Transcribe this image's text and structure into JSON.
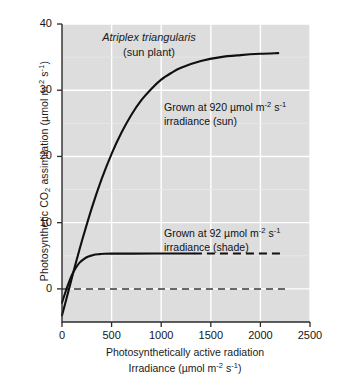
{
  "chart_data": {
    "type": "line",
    "title": "Atriplex triangularis",
    "subtitle": "(sun plant)",
    "xlabel_line1": "Photosynthetically active radiation",
    "xlabel_line2_prefix": "Irradiance (µmol m",
    "xlabel_line2_sup1": "-2",
    "xlabel_line2_mid": " s",
    "xlabel_line2_sup2": "-1",
    "xlabel_line2_suffix": ")",
    "ylabel_prefix": "Photosynthetic CO",
    "ylabel_sub": "2",
    "ylabel_mid": " assimilation (µmol m",
    "ylabel_sup1": "-2",
    "ylabel_mid2": " s",
    "ylabel_sup2": "-1",
    "ylabel_suffix": ")",
    "xlim": [
      0,
      2500
    ],
    "ylim": [
      -5,
      40
    ],
    "xticks": [
      0,
      500,
      1000,
      1500,
      2000,
      2500
    ],
    "xtick_labels": [
      "0",
      "500",
      "1000",
      "1500",
      "2000",
      "2500"
    ],
    "yticks": [
      0,
      10,
      20,
      30,
      40
    ],
    "ytick_labels": [
      "0",
      "10",
      "20",
      "30",
      "40"
    ],
    "grid": true,
    "grid_color": "#ffffff",
    "plot_bg": "#dddddd",
    "line_color": "#101010",
    "legend_position": "inline-annotation",
    "series": [
      {
        "name": "sun",
        "label_line1": "Grown at 920 µmol m",
        "label_sup1": "-2",
        "label_mid": " s",
        "label_sup2": "-1",
        "label_line2": "irradiance (sun)",
        "style": "solid",
        "x": [
          0,
          50,
          100,
          150,
          200,
          300,
          400,
          500,
          600,
          700,
          800,
          900,
          1000,
          1100,
          1200,
          1400,
          1600,
          1800,
          2000,
          2180
        ],
        "y": [
          -4.0,
          -1.2,
          1.7,
          4.5,
          7.2,
          12.2,
          16.6,
          20.4,
          23.6,
          26.3,
          28.5,
          30.2,
          31.6,
          32.6,
          33.4,
          34.4,
          35.0,
          35.3,
          35.5,
          35.6
        ]
      },
      {
        "name": "shade",
        "label_line1": "Grown at 92 µmol m",
        "label_sup1": "-2",
        "label_mid": " s",
        "label_sup2": "-1",
        "label_line2": "irradiance (shade)",
        "style": "solid-then-dashed",
        "dash_start_x": 1330,
        "x": [
          0,
          30,
          60,
          100,
          140,
          180,
          220,
          260,
          300,
          340,
          380,
          430,
          500,
          700,
          1000,
          1330
        ],
        "y": [
          -2.1,
          -0.7,
          0.6,
          2.1,
          3.2,
          4.0,
          4.5,
          4.85,
          5.05,
          5.2,
          5.25,
          5.3,
          5.32,
          5.33,
          5.34,
          5.35
        ],
        "dash_x": [
          1330,
          2220
        ],
        "dash_y": [
          5.35,
          5.35
        ]
      }
    ],
    "reference_lines": [
      {
        "name": "zero-line",
        "orientation": "horizontal",
        "value": 0,
        "style": "dashed",
        "x_start": 0,
        "x_end": 2250
      }
    ]
  }
}
